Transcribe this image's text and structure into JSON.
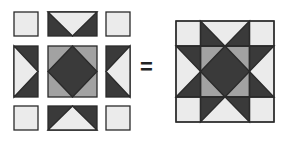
{
  "diagram": {
    "type": "quilt-block-assembly",
    "operator": "=",
    "colors": {
      "light": "#ebebeb",
      "medium": "#a2a2a2",
      "dark": "#3a3a3a",
      "outline": "#2a2a2a"
    },
    "left": {
      "label": "exploded-pieces",
      "pieces": [
        {
          "name": "corner-square-top-left",
          "kind": "square"
        },
        {
          "name": "flying-geese-top",
          "kind": "flying-geese",
          "point": "down"
        },
        {
          "name": "corner-square-top-right",
          "kind": "square"
        },
        {
          "name": "flying-geese-left",
          "kind": "flying-geese",
          "point": "right"
        },
        {
          "name": "center-square-in-square",
          "kind": "square-in-square"
        },
        {
          "name": "flying-geese-right",
          "kind": "flying-geese",
          "point": "left"
        },
        {
          "name": "corner-square-bottom-left",
          "kind": "square"
        },
        {
          "name": "flying-geese-bottom",
          "kind": "flying-geese",
          "point": "up"
        },
        {
          "name": "corner-square-bottom-right",
          "kind": "square"
        }
      ]
    },
    "right": {
      "label": "assembled-ohio-star-block"
    }
  }
}
